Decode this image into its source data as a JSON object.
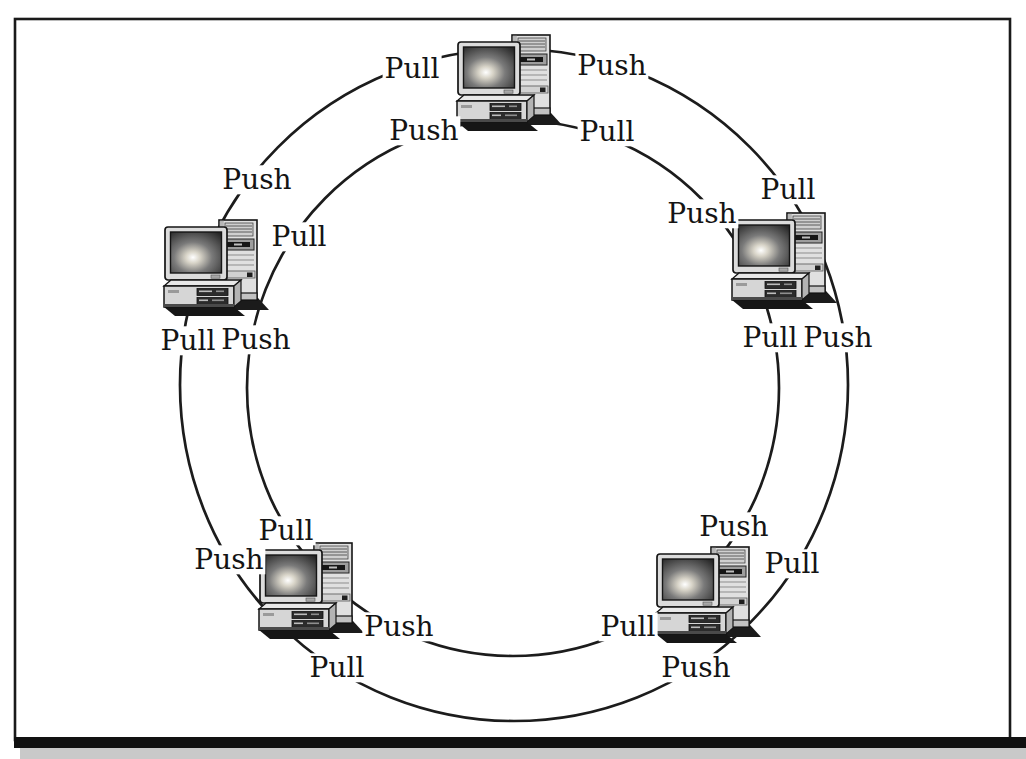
{
  "figure": {
    "node_count": 5,
    "colors": {
      "background": "#ffffff",
      "frame": "#1a1a1a",
      "ring": "#1c1c1c",
      "label_text": "#141414",
      "bottom_rule": "#111111",
      "bottom_band": "#c9c9c9"
    },
    "nodes": [
      {
        "name": "computer-top",
        "labels": {
          "outer_left": "Pull",
          "outer_right": "Push",
          "inner_left": "Push",
          "inner_right": "Pull"
        }
      },
      {
        "name": "computer-left",
        "labels": {
          "outer_top": "Push",
          "inner_right": "Pull",
          "outer_bottom": "Pull",
          "inner_bottom": "Push"
        }
      },
      {
        "name": "computer-right",
        "labels": {
          "inner_top": "Push",
          "outer_top": "Pull",
          "inner_bottom": "Pull",
          "outer_bottom": "Push"
        }
      },
      {
        "name": "computer-bottom-left",
        "labels": {
          "inner_top": "Pull",
          "outer_left": "Push",
          "inner_right": "Push",
          "outer_bottom": "Pull"
        }
      },
      {
        "name": "computer-bottom-right",
        "labels": {
          "inner_top": "Push",
          "outer_right": "Pull",
          "inner_left": "Pull",
          "outer_bottom": "Push"
        }
      }
    ]
  }
}
